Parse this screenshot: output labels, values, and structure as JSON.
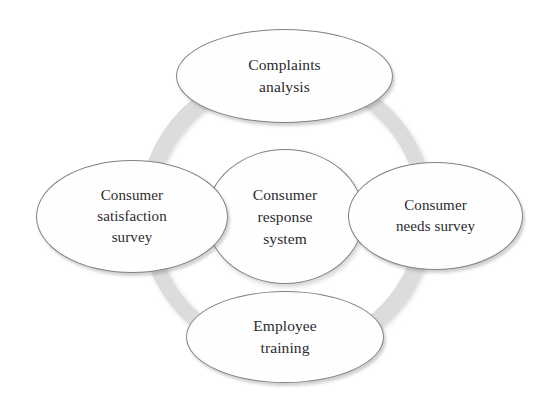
{
  "diagram": {
    "type": "cycle-diagram",
    "background_color": "#ffffff",
    "ring": {
      "name": "cycle-ring",
      "color": "#dcdcdc",
      "shadow_color": "#c9c9c9"
    },
    "node_style": {
      "fill": "#fefefe",
      "stroke": "#85827e",
      "text_color": "#2b2b2d"
    },
    "center": {
      "id": "consumer-response-system",
      "label": "Consumer\nresponse\nsystem",
      "line1": "Consumer",
      "line2": "response",
      "line3": "system"
    },
    "nodes": [
      {
        "id": "complaints-analysis",
        "position": "top",
        "label": "Complaints analysis",
        "line1": "Complaints",
        "line2": "analysis"
      },
      {
        "id": "consumer-needs-survey",
        "position": "right",
        "label": "Consumer needs survey",
        "line1": "Consumer",
        "line2": "needs survey"
      },
      {
        "id": "employee-training",
        "position": "bottom",
        "label": "Employee training",
        "line1": "Employee",
        "line2": "training"
      },
      {
        "id": "consumer-satisfaction-survey",
        "position": "left",
        "label": "Consumer satisfaction survey",
        "line1": "Consumer",
        "line2": "satisfaction",
        "line3": "survey"
      }
    ]
  }
}
